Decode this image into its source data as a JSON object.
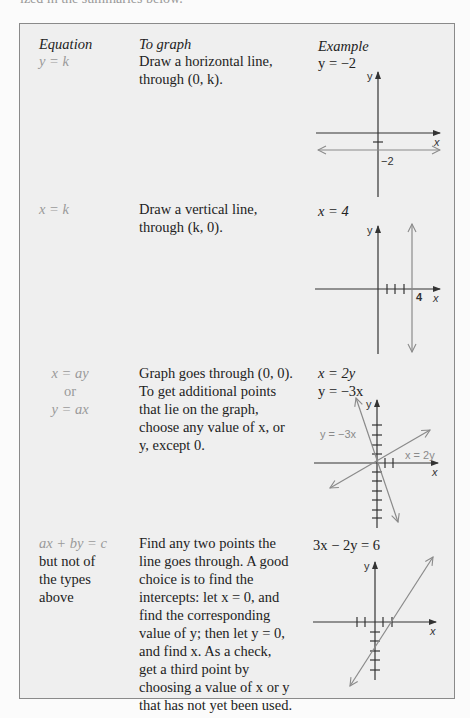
{
  "page_top_text": "ized in the summaries below.",
  "headers": {
    "equation": "Equation",
    "to_graph": "To graph",
    "example": "Example"
  },
  "rows": [
    {
      "equation_lines": [
        "y = k"
      ],
      "description_lines": [
        "Draw a horizontal line,",
        "through (0, k)."
      ],
      "example_lines": [
        "y = −2"
      ],
      "graph": {
        "axis_labels": {
          "x": "x",
          "y": "y"
        },
        "line_label": "−2",
        "line_type": "horizontal",
        "line_value": -2
      }
    },
    {
      "equation_lines": [
        "x = k"
      ],
      "description_lines": [
        "Draw a vertical line,",
        "through (k, 0)."
      ],
      "example_lines": [
        "x = 4"
      ],
      "graph": {
        "axis_labels": {
          "x": "x",
          "y": "y"
        },
        "line_label": "4",
        "line_type": "vertical",
        "line_value": 4
      }
    },
    {
      "equation_lines": [
        "x = ay",
        "or",
        "y = ax"
      ],
      "description_lines": [
        "Graph goes through (0, 0).",
        "To get additional points",
        "that lie on the graph,",
        "choose any value of x, or",
        "y, except 0."
      ],
      "example_lines": [
        "x = 2y",
        "y = −3x"
      ],
      "graph": {
        "axis_labels": {
          "x": "x",
          "y": "y"
        },
        "line_labels": [
          "y = −3x",
          "x = 2y"
        ]
      }
    },
    {
      "equation_lines": [
        "ax + by = c",
        "but not of",
        "the types",
        "above"
      ],
      "description_lines": [
        "Find any two points the",
        "line goes through. A good",
        "choice is to find the",
        "intercepts: let x = 0, and",
        "find the corresponding",
        "value of y; then let y = 0,",
        "and find x. As a check,",
        "get a third point by",
        "choosing a value of x or y",
        "that has not yet been used."
      ],
      "example_lines": [
        "3x − 2y = 6"
      ],
      "graph": {
        "axis_labels": {
          "x": "x",
          "y": "y"
        }
      }
    }
  ]
}
